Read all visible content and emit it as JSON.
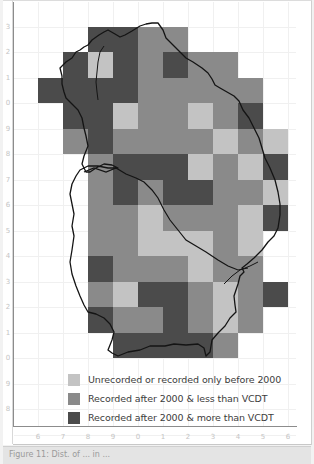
{
  "figure": {
    "type": "grid distribution map (tetrad/hectad)",
    "colors": {
      "unrecorded": "#c3c3c3",
      "recorded_less": "#8a8a8a",
      "recorded_more": "#4b4b4b",
      "outline": "#141414"
    },
    "y_axis_ticks": [
      "3",
      "2",
      "1",
      "0",
      "9",
      "8",
      "7",
      "6",
      "5",
      "4",
      "3",
      "2",
      "1",
      "0",
      "9",
      "8"
    ],
    "x_axis_ticks": [
      "6",
      "7",
      "8",
      "9",
      "0",
      "1",
      "2",
      "3",
      "4",
      "5",
      "6"
    ],
    "legend": [
      {
        "key": "U",
        "label": "Unrecorded  or recorded only before 2000",
        "color": "#c3c3c3"
      },
      {
        "key": "L",
        "label": "Recorded after 2000 & less than VCDT",
        "color": "#8a8a8a"
      },
      {
        "key": "M",
        "label": "Recorded after 2000 & more than VCDT",
        "color": "#4b4b4b"
      }
    ],
    "caption": "Figure 11: Dist. of ... in ..."
  },
  "chart_data": {
    "type": "heatmap",
    "title": "",
    "x_ticks": [
      "6",
      "7",
      "8",
      "9",
      "0",
      "1",
      "2",
      "3",
      "4",
      "5"
    ],
    "y_ticks_top_to_bottom": [
      "3",
      "2",
      "1",
      "0",
      "9",
      "8",
      "7",
      "6",
      "5",
      "4",
      "3",
      "2",
      "1",
      "0"
    ],
    "categories": {
      "U": "Unrecorded  or recorded only before 2000",
      "L": "Recorded after 2000 & less than VCDT",
      "M": "Recorded after 2000 & more than VCDT"
    },
    "grid": [
      [
        ".",
        ".",
        "M",
        "M",
        "L",
        "L",
        ".",
        ".",
        ".",
        "."
      ],
      [
        ".",
        "M",
        "U",
        "M",
        "L",
        "M",
        "L",
        "L",
        ".",
        "."
      ],
      [
        "M",
        "M",
        "M",
        "M",
        "L",
        "L",
        "L",
        "L",
        "L",
        "."
      ],
      [
        ".",
        "M",
        "M",
        "U",
        "L",
        "L",
        "U",
        "L",
        "M",
        "."
      ],
      [
        ".",
        "L",
        "M",
        "L",
        "L",
        "L",
        "L",
        "U",
        "L",
        "U"
      ],
      [
        ".",
        ".",
        "L",
        "M",
        "M",
        "M",
        "U",
        "L",
        "U",
        "M"
      ],
      [
        ".",
        ".",
        "L",
        "M",
        "L",
        "M",
        "M",
        "L",
        "L",
        "U"
      ],
      [
        ".",
        ".",
        "L",
        "L",
        "U",
        "L",
        "L",
        "L",
        "U",
        "M"
      ],
      [
        ".",
        ".",
        "L",
        "L",
        "U",
        "U",
        "U",
        "L",
        "U",
        "."
      ],
      [
        ".",
        ".",
        "M",
        "L",
        "L",
        "L",
        "U",
        "L",
        "L",
        "."
      ],
      [
        ".",
        ".",
        "L",
        "U",
        "M",
        "M",
        "L",
        "U",
        "L",
        "M"
      ],
      [
        ".",
        ".",
        "M",
        "L",
        "L",
        "M",
        "L",
        "U",
        "L",
        "."
      ],
      [
        ".",
        ".",
        ".",
        "M",
        "M",
        "M",
        "M",
        "L",
        ".",
        "."
      ]
    ]
  }
}
